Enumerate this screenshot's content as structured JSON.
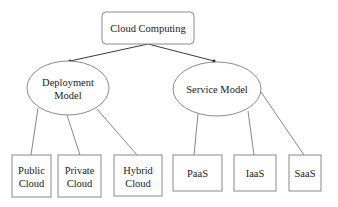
{
  "diagram": {
    "root": {
      "label": "Cloud Computing"
    },
    "branches": [
      {
        "label_lines": [
          "Deployment",
          "Model"
        ],
        "children": [
          {
            "lines": [
              "Public",
              "Cloud"
            ]
          },
          {
            "lines": [
              "Private",
              "Cloud"
            ]
          },
          {
            "lines": [
              "Hybrid",
              "Cloud"
            ]
          }
        ]
      },
      {
        "label_lines": [
          "Service Model"
        ],
        "children": [
          {
            "lines": [
              "PaaS"
            ]
          },
          {
            "lines": [
              "IaaS"
            ]
          },
          {
            "lines": [
              "SaaS"
            ]
          }
        ]
      }
    ],
    "colors": {
      "stroke": "#8a8a8a",
      "arrow": "#3a3a3a",
      "text": "#1a1a1a",
      "background": "#ffffff"
    }
  }
}
